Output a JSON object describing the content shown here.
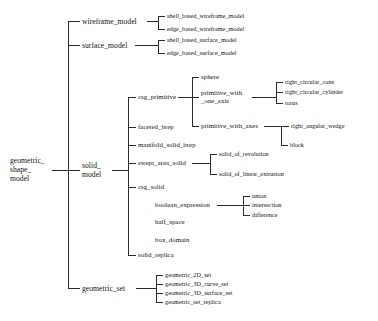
{
  "diagram": {
    "type": "tree",
    "root": "geometric_shape_model",
    "root_lines": [
      "geometric_",
      "shape_",
      "model"
    ],
    "nodes": {
      "wireframe_model": "wireframe_model",
      "shell_based_wireframe_model": "shell_based_wireframe_model",
      "edge_based_wireframe_model": "edge_based_wireframe_model",
      "surface_model": "surface_model",
      "shell_based_surface_model": "shell_based_surface_model",
      "edge_based_surface_model": "edge_based_surface_model",
      "solid_model_line1": "solid_",
      "solid_model_line2": "model",
      "csg_primitive": "csg_primitive",
      "sphere": "sphere",
      "primitive_with_one_axis_line1": "primitive_with",
      "primitive_with_one_axis_line2": "_one_axis",
      "right_circular_cone": "right_circular_cone",
      "right_circular_cylinder": "right_circular_cylinder",
      "torus": "torus",
      "primitive_with_axes": "primitive_with_axes",
      "right_angular_wedge": "right_angular_wedge",
      "block": "block",
      "faceted_brep": "faceted_brep",
      "manifold_solid_brep": "manifold_solid_brep",
      "swept_area_solid": "swept_area_solid",
      "solid_of_revolution": "solid_of_revolution",
      "solid_of_linear_extrusion": "solid_of_linear_extrusion",
      "csg_solid": "csg_solid",
      "boolean_expression": "boolean_expression",
      "union": "union",
      "intersection": "intersection",
      "difference": "difference",
      "half_space": "half_space",
      "box_domain": "box_domain",
      "solid_replica": "solid_replica",
      "geometric_set": "geometric_set",
      "geometric_2D_set": "geometric_2D_set",
      "geometric_3D_curve_set": "geometric_3D_curve_set",
      "geometric_3D_surface_set": "geometric_3D_surface_set",
      "geometric_set_replica": "geometric_set_replica"
    },
    "colors": {
      "background": "#ffffff",
      "text": "#111111",
      "line": "#2b2b2b"
    }
  }
}
